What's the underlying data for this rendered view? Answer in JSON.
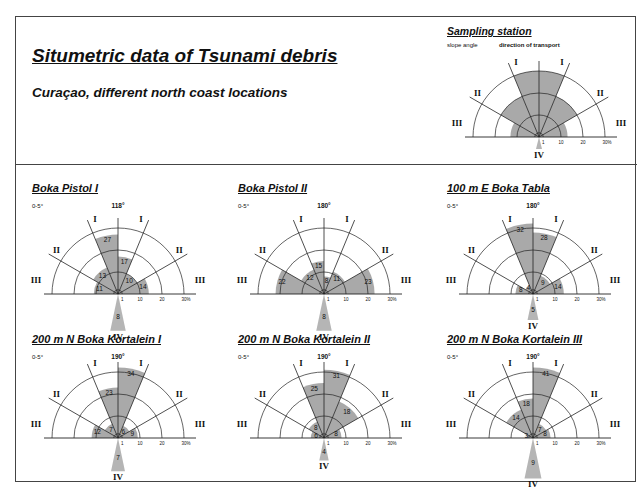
{
  "header": {
    "title": "Situmetric data of Tsunami debris",
    "subtitle": "Curaçao, different north coast locations"
  },
  "legend": {
    "title": "Sampling station",
    "slope_label": "slope angle",
    "direction_label": "direction of transport",
    "ring_labels": [
      "1",
      "10",
      "20",
      "30%"
    ],
    "sector_labels": {
      "I": "I",
      "II": "II",
      "III": "III",
      "IV": "IV"
    }
  },
  "colors": {
    "fill": "#a9a9a9",
    "wedge_iv": "#b5b5b5",
    "line": "#222222"
  },
  "chart_data": [
    {
      "type": "rose",
      "title": "Boka Pistol I",
      "slope": "0-5°",
      "azimuth": "118°",
      "scale": {
        "rings": [
          1,
          10,
          20,
          30
        ],
        "unit": "%"
      },
      "sectors": {
        "III_left": 11,
        "II_left": 13,
        "I_left": 27,
        "I_right": 17,
        "II_right": 10,
        "III_right": 14,
        "IV": 8
      }
    },
    {
      "type": "rose",
      "title": "Boka Pistol II",
      "slope": "0-5°",
      "azimuth": "180°",
      "scale": {
        "rings": [
          1,
          10,
          20,
          30
        ],
        "unit": "%"
      },
      "sectors": {
        "III_left": 22,
        "II_left": 12,
        "I_left": 15,
        "I_right": 8,
        "II_right": 11,
        "III_right": 23,
        "IV": 8
      }
    },
    {
      "type": "rose",
      "title": "100 m E Boka Tabla",
      "slope": "0-5°",
      "azimuth": "180°",
      "scale": {
        "rings": [
          1,
          10,
          20,
          30
        ],
        "unit": "%"
      },
      "sectors": {
        "III_left": 8,
        "II_left": 4,
        "I_left": 32,
        "I_right": 28,
        "II_right": 9,
        "III_right": 14,
        "IV": 5
      }
    },
    {
      "type": "rose",
      "title": "200 m N Boka Kortalein I",
      "slope": "0-5°",
      "azimuth": "190°",
      "scale": {
        "rings": [
          1,
          10,
          20,
          30
        ],
        "unit": "%"
      },
      "sectors": {
        "III_left": 12,
        "II_left": 7,
        "I_left": 23,
        "I_right": 34,
        "II_right": 6,
        "III_right": 9,
        "IV": 7
      }
    },
    {
      "type": "rose",
      "title": "200 m N Boka Kortalein II",
      "slope": "0-5°",
      "azimuth": "190°",
      "scale": {
        "rings": [
          1,
          10,
          20,
          30
        ],
        "unit": "%"
      },
      "sectors": {
        "III_left": 6,
        "II_left": 8,
        "I_left": 25,
        "I_right": 31,
        "II_right": 18,
        "III_right": 8,
        "IV": 4
      }
    },
    {
      "type": "rose",
      "title": "200 m N Boka Kortalein III",
      "slope": "0-5°",
      "azimuth": "190°",
      "scale": {
        "rings": [
          1,
          10,
          20,
          30
        ],
        "unit": "%"
      },
      "sectors": {
        "III_left": 3,
        "II_left": 14,
        "I_left": 18,
        "I_right": 41,
        "II_right": 7,
        "III_right": 8,
        "IV": 9
      }
    }
  ]
}
